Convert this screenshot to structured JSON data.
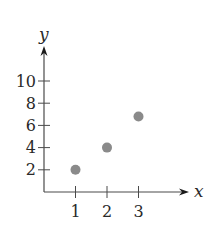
{
  "chart_data": {
    "type": "scatter",
    "title": "",
    "xlabel": "x",
    "ylabel": "y",
    "x": [
      1,
      2,
      3
    ],
    "y": [
      2,
      4,
      6.8
    ],
    "points": [
      {
        "x": 1,
        "y": 2
      },
      {
        "x": 2,
        "y": 4
      },
      {
        "x": 3,
        "y": 6.8
      }
    ],
    "x_ticks": [
      1,
      2,
      3
    ],
    "y_ticks": [
      2,
      4,
      6,
      8,
      10
    ],
    "xlim": [
      0,
      4.7
    ],
    "ylim": [
      0,
      13
    ],
    "grid": false,
    "legend": null,
    "colors": {
      "point": "#8a8a8a",
      "axis": "#4a4a4a",
      "text": "#2a2a2a"
    }
  },
  "layout": {
    "origin_px": [
      44,
      192
    ],
    "x_unit_px": 31.5,
    "y_unit_px": 11.1,
    "x_axis_end_px": 189,
    "y_axis_end_px": 46,
    "point_radius_px": 5
  }
}
